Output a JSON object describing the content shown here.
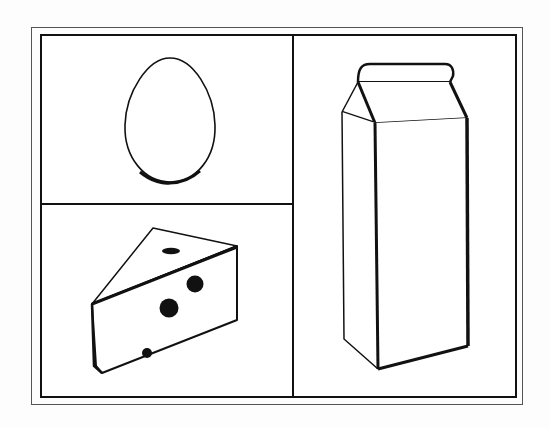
{
  "worksheet": {
    "layout": "three-panel picture card",
    "panels": [
      {
        "id": "top-left",
        "item": "egg"
      },
      {
        "id": "bottom-left",
        "item": "cheese wedge"
      },
      {
        "id": "right",
        "item": "milk carton"
      }
    ]
  },
  "colors": {
    "line": "#111111",
    "frame_outer": "#555555",
    "background": "#ffffff"
  }
}
